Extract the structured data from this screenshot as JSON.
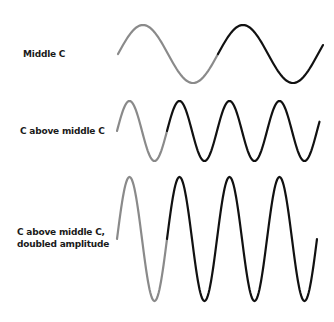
{
  "diagram": {
    "rows": [
      {
        "label_lines": [
          "Middle C"
        ],
        "frequency_ratio": 1,
        "amplitude_ratio": 1,
        "cycles_shown": 2.05,
        "first_cycle_color": "#8a8a8a",
        "rest_color": "#111111"
      },
      {
        "label_lines": [
          "C above middle C"
        ],
        "frequency_ratio": 2,
        "amplitude_ratio": 1,
        "cycles_shown": 4.05,
        "first_cycle_color": "#8a8a8a",
        "rest_color": "#111111"
      },
      {
        "label_lines": [
          "C above middle C,",
          "doubled amplitude"
        ],
        "frequency_ratio": 2,
        "amplitude_ratio": 2,
        "cycles_shown": 4.0,
        "first_cycle_color": "#8a8a8a",
        "rest_color": "#111111"
      }
    ]
  }
}
